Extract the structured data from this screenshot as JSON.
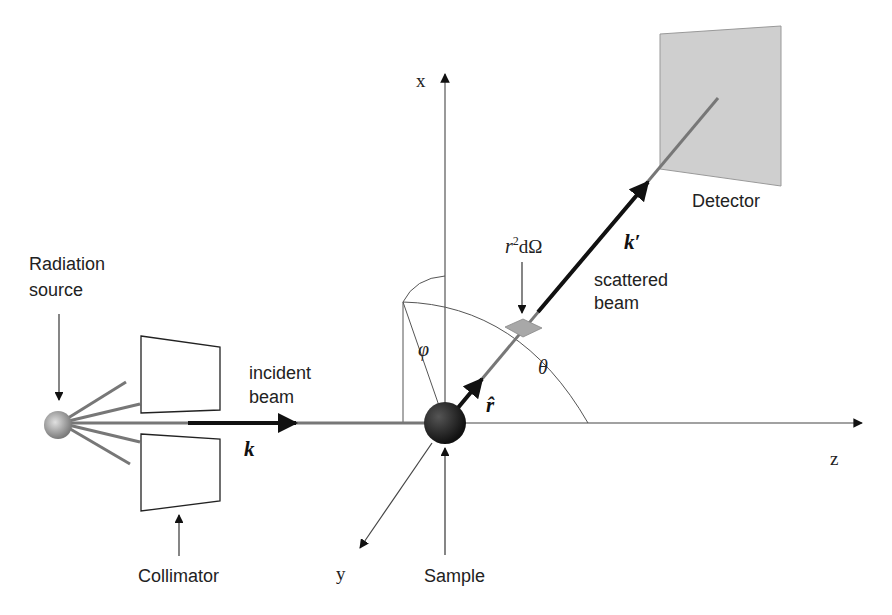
{
  "labels": {
    "radiation_source_line1": "Radiation",
    "radiation_source_line2": "source",
    "collimator": "Collimator",
    "incident_beam_line1": "incident",
    "incident_beam_line2": "beam",
    "incident_wavevector": "k",
    "sample": "Sample",
    "scattered_beam_line1": "scattered",
    "scattered_beam_line2": "beam",
    "scattered_wavevector": "k′",
    "detector": "Detector",
    "solid_angle_r": "r",
    "solid_angle_exp": "2",
    "solid_angle_rest": "dΩ",
    "unit_vector": "r̂",
    "theta": "θ",
    "phi": "φ",
    "axis_x": "x",
    "axis_y": "y",
    "axis_z": "z"
  },
  "colors": {
    "detector_fill": "#cfcfcf",
    "beam": "#777777",
    "sample": "#222222",
    "source": "#9a9a9a",
    "element_patch": "#a8a8a8"
  }
}
